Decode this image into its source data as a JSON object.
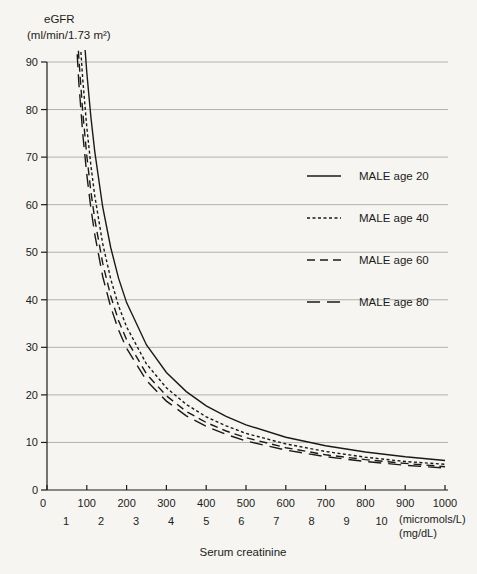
{
  "figure": {
    "y_axis_title_line1": "eGFR",
    "y_axis_title_line2": "(ml/min/1.73 m²)",
    "x_axis_title": "Serum creatinine",
    "x_unit_primary": "(micromols/L)",
    "x_unit_secondary": "(mg/dL)"
  },
  "colors": {
    "line": "#1a1a1a",
    "grid": "#b2b1ae",
    "axis": "#1c1c1c",
    "text": "#1c1c1c",
    "background": "#f6f5f1"
  },
  "chart_data": {
    "type": "line",
    "xlabel": "Serum creatinine",
    "ylabel": "eGFR (ml/min/1.73 m²)",
    "x_axis_units": [
      "micromols/L",
      "mg/dL"
    ],
    "xlim": [
      0,
      1000
    ],
    "ylim": [
      0,
      90
    ],
    "grid": "horizontal",
    "legend_position": "upper-right",
    "x_ticks_micromols": [
      0,
      100,
      200,
      300,
      400,
      500,
      600,
      700,
      800,
      900,
      1000
    ],
    "x_ticks_mgdl": [
      1,
      2,
      3,
      4,
      5,
      6,
      7,
      8,
      9,
      10
    ],
    "y_ticks": [
      0,
      10,
      20,
      30,
      40,
      50,
      60,
      70,
      80,
      90
    ],
    "x_micromols": [
      70,
      80,
      90,
      100,
      110,
      120,
      140,
      160,
      180,
      200,
      250,
      300,
      350,
      400,
      450,
      500,
      600,
      700,
      800,
      900,
      1000
    ],
    "series": [
      {
        "name": "MALE age 20",
        "line_style": "solid",
        "values": [
          132.5,
          113.5,
          99.1,
          87.8,
          78.6,
          71.1,
          59.5,
          51.0,
          44.5,
          39.4,
          30.5,
          24.7,
          20.7,
          17.7,
          15.5,
          13.7,
          11.1,
          9.3,
          8.0,
          7.0,
          6.2
        ]
      },
      {
        "name": "MALE age 40",
        "line_style": "dotted",
        "values": [
          115.2,
          98.7,
          86.2,
          76.3,
          68.4,
          61.8,
          51.8,
          44.4,
          38.7,
          34.3,
          26.5,
          21.5,
          18.0,
          15.4,
          13.5,
          11.9,
          9.7,
          8.1,
          6.9,
          6.0,
          5.4
        ]
      },
      {
        "name": "MALE age 60",
        "line_style": "dashed",
        "values": [
          106.0,
          90.9,
          79.3,
          70.3,
          62.9,
          56.9,
          47.7,
          40.8,
          35.6,
          31.6,
          24.4,
          19.8,
          16.5,
          14.2,
          12.4,
          11.0,
          8.9,
          7.4,
          6.4,
          5.6,
          4.9
        ]
      },
      {
        "name": "MALE age 80",
        "line_style": "long-dash",
        "values": [
          100.0,
          85.7,
          74.8,
          66.3,
          59.4,
          53.7,
          44.9,
          38.5,
          33.6,
          29.8,
          23.0,
          18.7,
          15.6,
          13.4,
          11.7,
          10.3,
          8.4,
          7.0,
          6.0,
          5.2,
          4.6
        ]
      }
    ]
  }
}
